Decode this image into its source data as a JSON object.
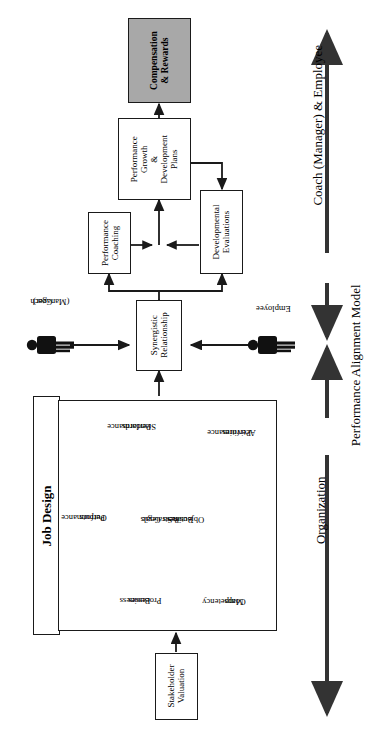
{
  "diagram": {
    "title": "Performance Alignment Model",
    "orientation": "rotated-90-ccw",
    "nodes": {
      "compensation": {
        "label": "Compensation\n& Rewards",
        "line1": "Compensation",
        "line2": "& Rewards",
        "fill": "#a8a8a8"
      },
      "growth_plans": {
        "line1": "Performance",
        "line2": "Growth",
        "line3": "&",
        "line4": "Development",
        "line5": "Plans"
      },
      "coaching": {
        "line1": "Performance",
        "line2": "Coaching"
      },
      "evaluations": {
        "line1": "Developmental",
        "line2": "Evaluations"
      },
      "synergistic": {
        "line1": "Synergistic",
        "line2": "Relationship"
      },
      "stakeholder": {
        "line1": "Stakeholder",
        "line2": "Valuation"
      },
      "job_design": {
        "label": "Job Design"
      }
    },
    "actors": {
      "coach": {
        "line1": "Coach",
        "line2": "(Manager)",
        "icon": "person-icon"
      },
      "employee": {
        "line1": "Employee",
        "icon": "person-icon"
      }
    },
    "job_design_nodes": [
      {
        "id": "performance-outputs",
        "line1": "Performance",
        "line2": "Outputs"
      },
      {
        "id": "performance-standards",
        "line1": "Performance",
        "line2": "Standards"
      },
      {
        "id": "performance-activities",
        "line1": "Performance",
        "line2": "Activities"
      },
      {
        "id": "strategic-business-goals",
        "line1": "Strategic",
        "line2": "Business Goals",
        "line3": "&",
        "line4": "Objectives"
      },
      {
        "id": "business-processes",
        "line1": "Business",
        "line2": "Processes"
      },
      {
        "id": "competency-maps",
        "line1": "Competency",
        "line2": "Maps"
      }
    ],
    "axis": {
      "upper_label": "Coach (Manager) & Employee",
      "lower_label": "Organization",
      "model_label": "Performance Alignment Model"
    },
    "colors": {
      "stroke": "#1a1a1a",
      "fill_grey": "#a8a8a8",
      "background": "#ffffff",
      "person": "#111111"
    }
  }
}
